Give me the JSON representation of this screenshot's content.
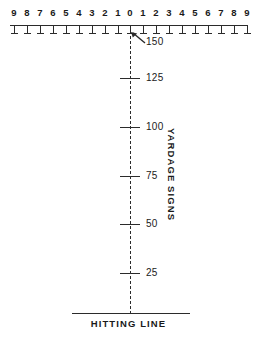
{
  "lateral_scale": {
    "labels": [
      "9",
      "8",
      "7",
      "6",
      "5",
      "4",
      "3",
      "2",
      "1",
      "0",
      "1",
      "2",
      "3",
      "4",
      "5",
      "6",
      "7",
      "8",
      "9"
    ],
    "positions_px": [
      14,
      27,
      40,
      53,
      66,
      79,
      92,
      105,
      118,
      130,
      143,
      156,
      169,
      182,
      195,
      208,
      221,
      234,
      247
    ]
  },
  "callout": {
    "value": "150",
    "arrow_icon": "arrow-up-left-icon"
  },
  "yardage_ticks": [
    {
      "label": "125",
      "y": 78
    },
    {
      "label": "100",
      "y": 127
    },
    {
      "label": "75",
      "y": 176
    },
    {
      "label": "50",
      "y": 224
    },
    {
      "label": "25",
      "y": 273
    }
  ],
  "side_label": {
    "text": "YARDAGE  SIGNS"
  },
  "hitting_line": {
    "label": "HITTING LINE"
  },
  "caption_sliver": {
    "text": ""
  },
  "colors": {
    "ink": "#2b2b2b",
    "text": "#1a1a1a",
    "background": "#ffffff"
  },
  "chart_data": {
    "type": "scatter",
    "xlabel": "Lateral position marker",
    "ylabel": "Distance from hitting line (yards)",
    "x": [
      -9,
      -8,
      -7,
      -6,
      -5,
      -4,
      -3,
      -2,
      -1,
      0,
      1,
      2,
      3,
      4,
      5,
      6,
      7,
      8,
      9
    ],
    "xticklabels": [
      "9",
      "8",
      "7",
      "6",
      "5",
      "4",
      "3",
      "2",
      "1",
      "0",
      "1",
      "2",
      "3",
      "4",
      "5",
      "6",
      "7",
      "8",
      "9"
    ],
    "yticks": [
      25,
      50,
      75,
      100,
      125,
      150
    ],
    "yticklabels": [
      "25",
      "50",
      "75",
      "100",
      "125",
      "150"
    ],
    "ylim": [
      0,
      150
    ],
    "xlim": [
      -9.5,
      9.5
    ],
    "grid": false,
    "legend": null,
    "annotations": [
      {
        "text": "150",
        "x": 0,
        "y": 150
      },
      {
        "text": "YARDAGE  SIGNS",
        "x": 3.5,
        "y": 75
      },
      {
        "text": "HITTING LINE",
        "x": 0,
        "y": 0
      }
    ],
    "series": [
      {
        "name": "Yardage signs on centerline",
        "x": [
          0,
          0,
          0,
          0,
          0,
          0
        ],
        "values": [
          25,
          50,
          75,
          100,
          125,
          150
        ]
      }
    ]
  }
}
